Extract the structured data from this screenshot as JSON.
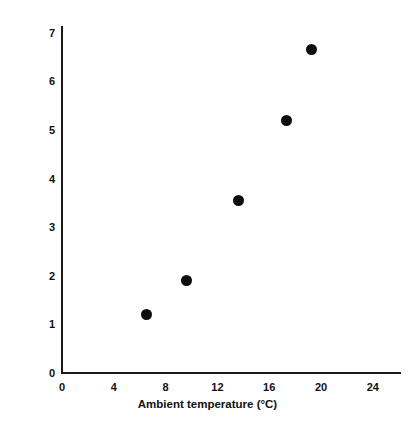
{
  "chart_data": {
    "type": "scatter",
    "title": "",
    "xlabel": "Ambient temperature (°C)",
    "ylabel": "Maximum rate of warm-up (°C/min)",
    "xlim": [
      0,
      26.2
    ],
    "ylim": [
      0,
      7.15
    ],
    "grid": false,
    "legend": null,
    "xticks": [
      0,
      4,
      8,
      12,
      16,
      20,
      24
    ],
    "xtick_labels": [
      "0",
      "4",
      "8",
      "12",
      "16",
      "20",
      "24"
    ],
    "yticks": [
      0,
      1,
      2,
      3,
      4,
      5,
      6,
      7
    ],
    "ytick_labels": [
      "0",
      "1",
      "2",
      "3",
      "4",
      "5",
      "6",
      "7"
    ],
    "series": [
      {
        "name": "Maximum rate of warm-up",
        "marker": "filled-circle",
        "color": "#0d0d0d",
        "points": [
          {
            "x": 6.5,
            "y": 1.2
          },
          {
            "x": 9.6,
            "y": 1.9
          },
          {
            "x": 13.6,
            "y": 3.55
          },
          {
            "x": 17.3,
            "y": 5.2
          },
          {
            "x": 19.3,
            "y": 6.65
          }
        ]
      }
    ]
  },
  "axis_color": "#1a1a1a",
  "background_color": "#ffffff"
}
